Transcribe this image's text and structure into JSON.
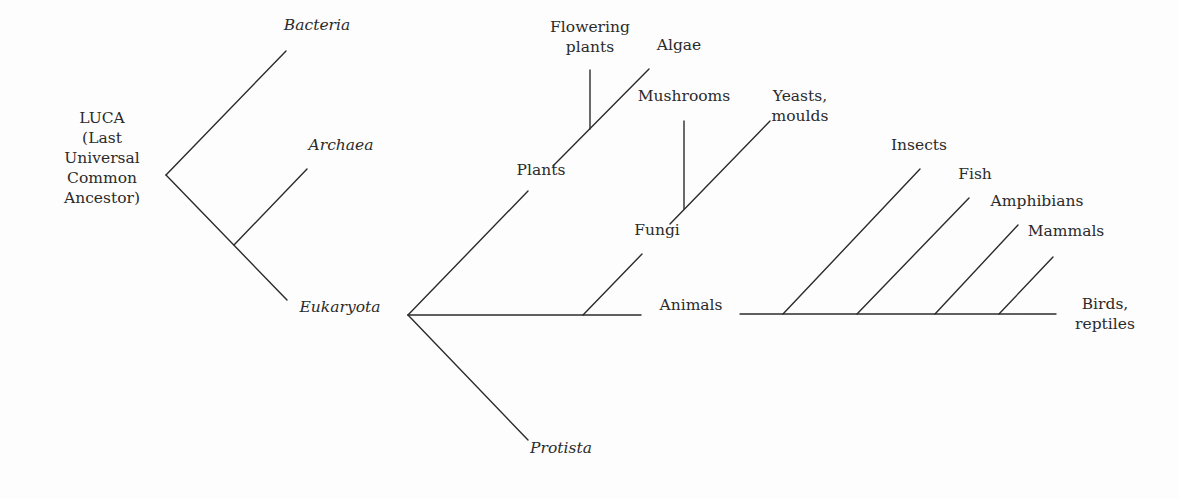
{
  "diagram": {
    "type": "phylogenetic-tree",
    "line_color": "#2b2b2b",
    "background": "#fdfdfd",
    "nodes": [
      {
        "id": "luca",
        "label": "LUCA\n(Last\nUniversal\nCommon\nAncestor)",
        "italic": false,
        "x": 102,
        "y": 118
      },
      {
        "id": "bacteria",
        "label": "Bacteria",
        "italic": true,
        "x": 317,
        "y": 25
      },
      {
        "id": "archaea",
        "label": "Archaea",
        "italic": true,
        "x": 341,
        "y": 145
      },
      {
        "id": "eukaryota",
        "label": "Eukaryota",
        "italic": true,
        "x": 340,
        "y": 307
      },
      {
        "id": "plants",
        "label": "Plants",
        "italic": false,
        "x": 541,
        "y": 170
      },
      {
        "id": "flowering_plants",
        "label": "Flowering\nplants",
        "italic": false,
        "x": 590,
        "y": 27
      },
      {
        "id": "algae",
        "label": "Algae",
        "italic": false,
        "x": 679,
        "y": 45
      },
      {
        "id": "mushrooms",
        "label": "Mushrooms",
        "italic": false,
        "x": 684,
        "y": 96
      },
      {
        "id": "yeasts_moulds",
        "label": "Yeasts,\nmoulds",
        "italic": false,
        "x": 800,
        "y": 96
      },
      {
        "id": "fungi",
        "label": "Fungi",
        "italic": false,
        "x": 657,
        "y": 230
      },
      {
        "id": "animals",
        "label": "Animals",
        "italic": false,
        "x": 691,
        "y": 305
      },
      {
        "id": "protista",
        "label": "Protista",
        "italic": true,
        "x": 561,
        "y": 448
      },
      {
        "id": "insects",
        "label": "Insects",
        "italic": false,
        "x": 919,
        "y": 145
      },
      {
        "id": "fish",
        "label": "Fish",
        "italic": false,
        "x": 975,
        "y": 174
      },
      {
        "id": "amphibians",
        "label": "Amphibians",
        "italic": false,
        "x": 1037,
        "y": 201
      },
      {
        "id": "mammals",
        "label": "Mammals",
        "italic": false,
        "x": 1066,
        "y": 231
      },
      {
        "id": "birds_reptiles",
        "label": "Birds,\nreptiles",
        "italic": false,
        "x": 1105,
        "y": 304
      }
    ],
    "edges": [
      {
        "id": "luca-bacteria",
        "x1": 166,
        "y1": 175,
        "x2": 286,
        "y2": 51
      },
      {
        "id": "luca-eukaryota",
        "x1": 166,
        "y1": 175,
        "x2": 287,
        "y2": 300
      },
      {
        "id": "archaea-branch",
        "x1": 234,
        "y1": 245,
        "x2": 307,
        "y2": 169
      },
      {
        "id": "euk-plants",
        "x1": 408,
        "y1": 315,
        "x2": 528,
        "y2": 191
      },
      {
        "id": "plants-algae",
        "x1": 553,
        "y1": 166,
        "x2": 649,
        "y2": 69
      },
      {
        "id": "flowering-plants",
        "x1": 590,
        "y1": 129,
        "x2": 590,
        "y2": 70
      },
      {
        "id": "euk-animals-a",
        "x1": 408,
        "y1": 315,
        "x2": 641,
        "y2": 315
      },
      {
        "id": "fungi-branch",
        "x1": 583,
        "y1": 315,
        "x2": 642,
        "y2": 254
      },
      {
        "id": "fungi-yeasts",
        "x1": 670,
        "y1": 224,
        "x2": 770,
        "y2": 121
      },
      {
        "id": "mushrooms",
        "x1": 684,
        "y1": 209,
        "x2": 684,
        "y2": 121
      },
      {
        "id": "euk-protista",
        "x1": 408,
        "y1": 315,
        "x2": 528,
        "y2": 440
      },
      {
        "id": "animals-line",
        "x1": 740,
        "y1": 314,
        "x2": 1056,
        "y2": 314
      },
      {
        "id": "insects-branch",
        "x1": 783,
        "y1": 314,
        "x2": 920,
        "y2": 169
      },
      {
        "id": "fish-branch",
        "x1": 857,
        "y1": 314,
        "x2": 969,
        "y2": 198
      },
      {
        "id": "amphibians-branch",
        "x1": 935,
        "y1": 314,
        "x2": 1018,
        "y2": 225
      },
      {
        "id": "mammals-branch",
        "x1": 999,
        "y1": 314,
        "x2": 1053,
        "y2": 257
      }
    ]
  }
}
